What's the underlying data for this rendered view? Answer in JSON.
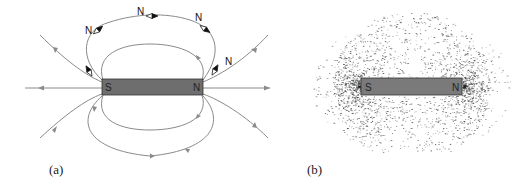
{
  "figure": {
    "panels": [
      {
        "id": "a",
        "caption": "(a)",
        "description": "Bar magnet with field lines and compass needles",
        "magnet": {
          "south_label": "S",
          "north_label": "N",
          "color": "#6e6e6e"
        },
        "compass_labels": [
          "N",
          "N",
          "N",
          "N"
        ]
      },
      {
        "id": "b",
        "caption": "(b)",
        "description": "Iron filings pattern around a bar magnet",
        "magnet": {
          "south_label": "S",
          "north_label": "N",
          "color": "#7a7a7a"
        }
      }
    ],
    "colors": {
      "field_line": "#8a8a8a",
      "magnet_fill": "#6e6e6e",
      "magnet_border": "#333333",
      "filings": "#2a2a2a"
    }
  }
}
